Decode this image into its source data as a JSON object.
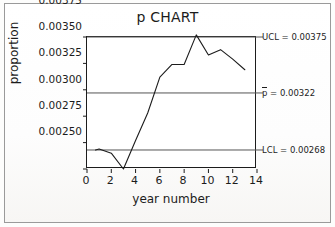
{
  "figure": {
    "title": "p  CHART",
    "kind": "statistical-process-control-p-chart"
  },
  "axes": {
    "xlabel": "year number",
    "ylabel": "proportion",
    "xticks": [
      "0",
      "2",
      "4",
      "6",
      "8",
      "10",
      "12",
      "14"
    ],
    "yticks": [
      "0.00375",
      "0.00350",
      "0.00325",
      "0.00300",
      "0.00275",
      "0.00250"
    ]
  },
  "limits": {
    "ucl_label": "UCL = 0.00375",
    "center_label_prefix": "p",
    "center_label_suffix": " = 0.00322",
    "lcl_label": "LCL = 0.00268"
  },
  "chart_data": {
    "type": "line",
    "title": "p  CHART",
    "xlabel": "year number",
    "ylabel": "proportion",
    "xlim": [
      0,
      14
    ],
    "ylim": [
      0.0025,
      0.00375
    ],
    "xticks": [
      0,
      2,
      4,
      6,
      8,
      10,
      12,
      14
    ],
    "yticks": [
      0.0025,
      0.00275,
      0.003,
      0.00325,
      0.0035,
      0.00375
    ],
    "grid": false,
    "legend": null,
    "x": [
      0.7,
      1,
      2,
      3,
      4,
      5,
      6,
      7,
      8,
      9,
      10,
      11,
      12,
      13
    ],
    "series": [
      {
        "name": "proportion",
        "values": [
          0.00268,
          0.00269,
          0.00265,
          0.0025,
          0.00277,
          0.00303,
          0.00337,
          0.00349,
          0.00349,
          0.00377,
          0.00358,
          0.00363,
          0.00354,
          0.00344
        ]
      }
    ],
    "control_limits": {
      "UCL": 0.00375,
      "center": 0.00322,
      "LCL": 0.00268
    },
    "annotations": [
      {
        "text": "UCL = 0.00375",
        "value": 0.00375,
        "position": "right"
      },
      {
        "text": "p = 0.00322",
        "value": 0.00322,
        "position": "right"
      },
      {
        "text": "LCL = 0.00268",
        "value": 0.00268,
        "position": "right"
      }
    ]
  },
  "colors": {
    "ink": "#1c1c1c",
    "limit_line": "#555555",
    "paper": "#ffffff",
    "border": "#9a9a9a"
  }
}
